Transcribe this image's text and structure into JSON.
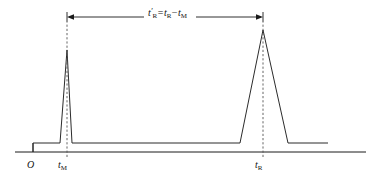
{
  "figure": {
    "kind": "chromatogram-diagram",
    "background_color": "#ffffff",
    "line_color": "#2b2b2b",
    "axis_color": "#1a1a1a",
    "dash_color": "#555555"
  },
  "axis": {
    "origin_label": "O",
    "x_start_px": 15,
    "x_end_px": 366,
    "y_px": 152
  },
  "markers": [
    {
      "name": "dead-time-marker",
      "label_base": "t",
      "label_sub": "M",
      "label_prime": "",
      "x_px": 67
    },
    {
      "name": "retention-time-marker",
      "label_base": "t",
      "label_sub": "R",
      "label_prime": "",
      "x_px": 263
    }
  ],
  "measure": {
    "name": "adjusted-retention-time",
    "formula_base": "t",
    "formula_prime": "′",
    "formula_sub1": "R",
    "formula_equals": "=",
    "formula_term2_base": "t",
    "formula_term2_sub": "R",
    "formula_minus": "−",
    "formula_term3_base": "t",
    "formula_term3_sub": "M",
    "formula_text": "t′R = tR − tM",
    "x_left_px": 67,
    "x_right_px": 263,
    "y_px": 17
  },
  "chart_data": {
    "type": "line",
    "title": "",
    "xlabel": "",
    "ylabel": "",
    "xlim": [
      15,
      366
    ],
    "ylim": [
      0,
      152
    ],
    "grid": false,
    "legend": null,
    "annotations": [
      {
        "text": "O",
        "x": 33,
        "y": 163,
        "role": "origin-label"
      },
      {
        "text": "tM",
        "x": 67,
        "y": 163,
        "role": "x-tick-label"
      },
      {
        "text": "tR",
        "x": 263,
        "y": 163,
        "role": "x-tick-label"
      },
      {
        "text": "t'R = tR - tM",
        "x": 165,
        "y": 17,
        "role": "measure-label"
      }
    ],
    "series": [
      {
        "name": "detector-signal",
        "points_px": [
          [
            33,
            152
          ],
          [
            33,
            143
          ],
          [
            58,
            143
          ],
          [
            60,
            143
          ],
          [
            67,
            50
          ],
          [
            72,
            143
          ],
          [
            240,
            143
          ],
          [
            263,
            30
          ],
          [
            288,
            143
          ],
          [
            328,
            143
          ]
        ]
      }
    ],
    "peaks": [
      {
        "name": "unretained-peak",
        "apex_x_px": 67,
        "apex_y_px": 50,
        "width_px": 14,
        "label": "tM"
      },
      {
        "name": "analyte-peak",
        "apex_x_px": 263,
        "apex_y_px": 30,
        "width_px": 48,
        "label": "tR"
      }
    ],
    "baseline_y_px": 143
  }
}
